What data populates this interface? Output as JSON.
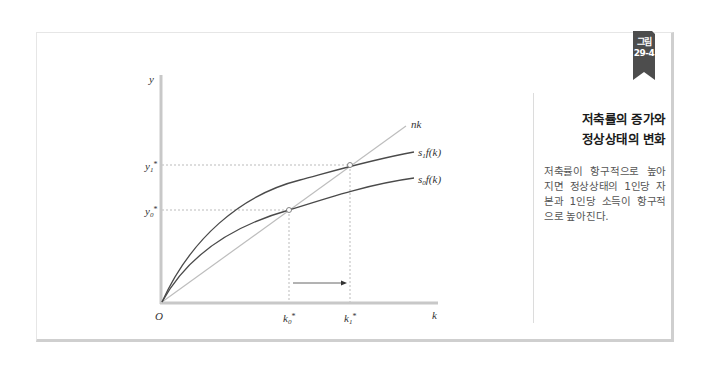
{
  "figure": {
    "badge_line1": "그림",
    "badge_line2": "29-4",
    "title_line1": "저축률의 증가와",
    "title_line2": "정상상태의 변화",
    "caption": "저축률이 항구적으로 높아지면 정상상태의 1인당 자본과 1인당 소득이 항구적으로 높아진다."
  },
  "diagram": {
    "axis_y_label": "y",
    "axis_x_label": "k",
    "origin_label": "O",
    "y1_label": {
      "base": "y",
      "sub": "1",
      "sup": "*"
    },
    "y0_label": {
      "base": "y",
      "sub": "0",
      "sup": "*"
    },
    "k0_label": {
      "base": "k",
      "sub": "0",
      "sup": "*"
    },
    "k1_label": {
      "base": "k",
      "sub": "1",
      "sup": "*"
    },
    "line_nk_label": "nk",
    "curve_s1_label": {
      "s": "s",
      "sub": "1",
      "rest": "f(k)"
    },
    "curve_s0_label": {
      "s": "s",
      "sub": "0",
      "rest": "f(k)"
    },
    "colors": {
      "axis": "#c8c8c8",
      "curve": "#4a4a4a",
      "nk_line": "#bdbdbd",
      "dashed": "#bbbbbb",
      "badge": "#4d4d4d"
    }
  }
}
